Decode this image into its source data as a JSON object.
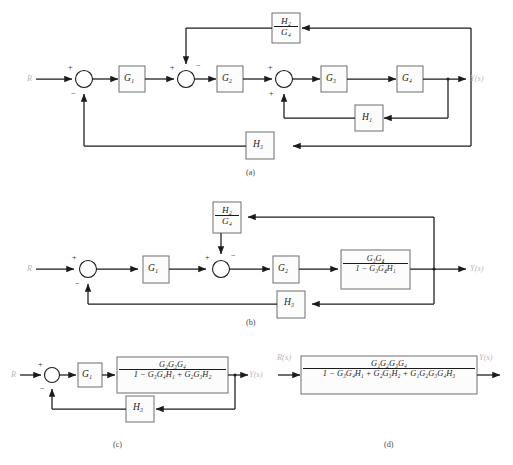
{
  "figure": {
    "type": "control-block-diagram",
    "subfigures": [
      {
        "id": "a",
        "caption": "(a)",
        "input_label": "R",
        "output_label": "Y(s)",
        "summing_junctions": [
          {
            "id": "s1",
            "left_sign": "+",
            "bottom_sign": "−"
          },
          {
            "id": "s2",
            "left_sign": "+",
            "top_sign": "−"
          },
          {
            "id": "s3",
            "left_sign": "+",
            "bottom_sign": "+"
          }
        ],
        "forward_blocks": [
          "G1",
          "G2",
          "G3",
          "G4"
        ],
        "feedback_blocks": [
          "H1",
          "H3"
        ],
        "fraction_blocks": [
          {
            "num": "H2",
            "den": "G4"
          }
        ]
      },
      {
        "id": "b",
        "caption": "(b)",
        "input_label": "R",
        "output_label": "Y(s)",
        "summing_junctions": [
          {
            "id": "s1",
            "left_sign": "+",
            "bottom_sign": "−"
          },
          {
            "id": "s2",
            "left_sign": "+",
            "top_sign": "−"
          }
        ],
        "forward_blocks": [
          "G1",
          "G2"
        ],
        "feedback_blocks": [
          "H3"
        ],
        "fraction_blocks": [
          {
            "num": "H2",
            "den": "G4"
          },
          {
            "num": "G3G4",
            "den": "1 − G3G4H1"
          }
        ]
      },
      {
        "id": "c",
        "caption": "(c)",
        "input_label": "R",
        "output_label": "Y(s)",
        "summing_junctions": [
          {
            "id": "s1",
            "left_sign": "+",
            "bottom_sign": "−"
          }
        ],
        "forward_blocks": [
          "G1"
        ],
        "feedback_blocks": [
          "H3"
        ],
        "fraction_blocks": [
          {
            "num": "G2G3G4",
            "den": "1 − G3G4H1 + G2G3H2"
          }
        ]
      },
      {
        "id": "d",
        "caption": "(d)",
        "input_label": "R(s)",
        "output_label": "Y(s)",
        "summing_junctions": [],
        "forward_blocks": [],
        "feedback_blocks": [],
        "fraction_blocks": [
          {
            "num": "G1G2G3G4",
            "den": "1 − G3G4H1 + G2G3H2 + G1G2G3G4H3"
          }
        ]
      }
    ],
    "symbols": {
      "G1": "G₁",
      "G2": "G₂",
      "G3": "G₃",
      "G4": "G₄",
      "H1": "H₁",
      "H2": "H₂",
      "H3": "H₃",
      "minus": "−",
      "plus": "+"
    },
    "style": {
      "line_color": "#1b1b1b",
      "block_fill": "#fcfcfc",
      "block_stroke": "#6e6e6e",
      "background": "#ffffff"
    }
  }
}
